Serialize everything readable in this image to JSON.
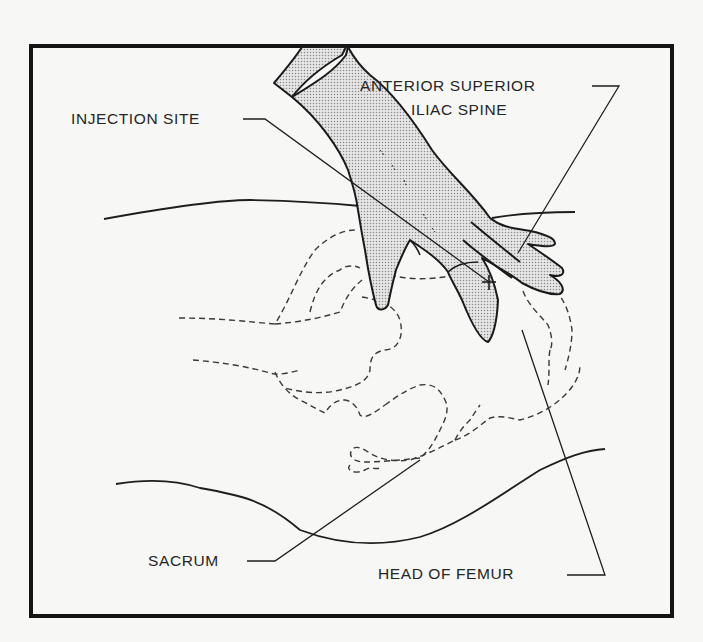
{
  "figure": {
    "type": "anatomical-illustration",
    "colors": {
      "background": "#f7f7f5",
      "line": "#1e1e1e",
      "frame": "#151515",
      "hand_fill": "#cfcfcf",
      "text": "#262626"
    }
  },
  "labels": {
    "injection_site": "INJECTION SITE",
    "asis_line1": "ANTERIOR SUPERIOR",
    "asis_line2": "ILIAC SPINE",
    "sacrum": "SACRUM",
    "head_of_femur": "HEAD OF FEMUR"
  },
  "markers": {
    "injection_cross": "+"
  }
}
